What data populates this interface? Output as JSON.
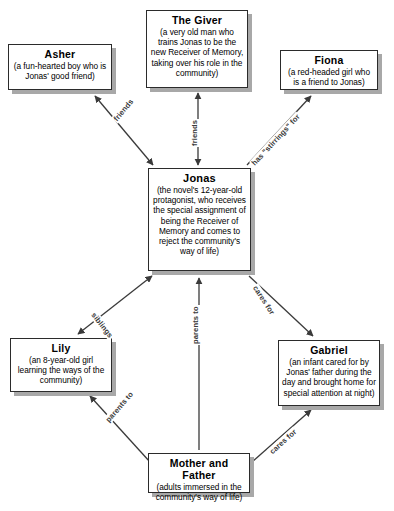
{
  "diagram": {
    "background_color": "#ffffff",
    "node_border_color": "#2b2b2b",
    "node_shadow_color": "#a8a8a8",
    "edge_color": "#3a3a3a",
    "nodes": [
      {
        "id": "asher",
        "title": "Asher",
        "desc": "(a fun-hearted boy who is Jonas' good friend)"
      },
      {
        "id": "giver",
        "title": "The Giver",
        "desc": "(a very old man who trains Jonas to be the new Receiver of Memory, taking over his role in the community)"
      },
      {
        "id": "fiona",
        "title": "Fiona",
        "desc": "(a red-headed girl who is a friend to Jonas)"
      },
      {
        "id": "jonas",
        "title": "Jonas",
        "desc": "(the novel's 12-year-old protagonist, who receives the special assignment of being the Receiver of Memory and comes to reject the community's way of life)"
      },
      {
        "id": "lily",
        "title": "Lily",
        "desc": "(an 8-year-old girl learning the ways of the community)"
      },
      {
        "id": "gabriel",
        "title": "Gabriel",
        "desc": "(an infant cared for by Jonas' father during the day and brought home for special attention at night)"
      },
      {
        "id": "parents",
        "title": "Mother and Father",
        "desc": "(adults immersed in the community's way of life)"
      }
    ],
    "edges": [
      {
        "id": "jonas-asher",
        "from": "jonas",
        "to": "asher",
        "label": "friends",
        "arrows": "both"
      },
      {
        "id": "jonas-giver",
        "from": "jonas",
        "to": "giver",
        "label": "friends",
        "arrows": "both"
      },
      {
        "id": "jonas-fiona",
        "from": "jonas",
        "to": "fiona",
        "label": "has \"stirrings\" for",
        "arrows": "end"
      },
      {
        "id": "jonas-lily",
        "from": "jonas",
        "to": "lily",
        "label": "siblings",
        "arrows": "both"
      },
      {
        "id": "jonas-gabriel",
        "from": "jonas",
        "to": "gabriel",
        "label": "cares for",
        "arrows": "end"
      },
      {
        "id": "parents-jonas",
        "from": "parents",
        "to": "jonas",
        "label": "parents to",
        "arrows": "end"
      },
      {
        "id": "parents-lily",
        "from": "parents",
        "to": "lily",
        "label": "parents to",
        "arrows": "end"
      },
      {
        "id": "parents-gabriel",
        "from": "parents",
        "to": "gabriel",
        "label": "cares for",
        "arrows": "end"
      }
    ]
  }
}
